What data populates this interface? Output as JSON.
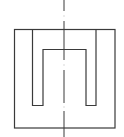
{
  "diagram": {
    "type": "technical-drawing",
    "stroke_color": "#3a3a3a",
    "background": "#ffffff",
    "outer_rect": {
      "x": 14.5,
      "y": 29.5,
      "width": 100.5,
      "height": 98.5
    },
    "u_shape": {
      "points": [
        [
          32.5,
          29.5
        ],
        [
          32.5,
          105.5
        ],
        [
          43,
          105.5
        ],
        [
          43,
          49.5
        ],
        [
          86,
          49.5
        ],
        [
          86,
          105.5
        ],
        [
          96,
          105.5
        ],
        [
          96,
          29.5
        ]
      ]
    },
    "center_line": {
      "x": 64,
      "segments": [
        [
          0,
          11
        ],
        [
          21,
          60
        ],
        [
          70,
          103
        ],
        [
          111,
          137
        ]
      ],
      "dots": [
        16,
        65,
        107
      ]
    }
  }
}
